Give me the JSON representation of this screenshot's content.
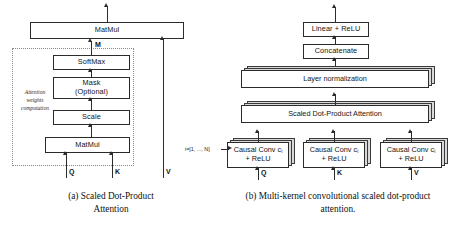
{
  "figure": {
    "panels": [
      {
        "id": "a",
        "caption_label": "(a)",
        "caption": "(a) Scaled Dot-Product\nAttention",
        "caption_line1": "(a) Scaled Dot-Product",
        "caption_line2": "Attention",
        "group_label_line1": "Attention",
        "group_label_line2": "weights",
        "group_label_line3": "computation",
        "nodes": [
          {
            "id": "matmul_top",
            "label": "MatMul"
          },
          {
            "id": "softmax",
            "label": "SoftMax"
          },
          {
            "id": "mask_l1",
            "label": "Mask"
          },
          {
            "id": "mask_l2",
            "label": "(Optional)"
          },
          {
            "id": "scale",
            "label": "Scale"
          },
          {
            "id": "matmul_bottom",
            "label": "MatMul"
          }
        ],
        "edge_labels": [
          {
            "id": "m",
            "label": "M"
          }
        ],
        "inputs": [
          {
            "id": "q",
            "label": "Q"
          },
          {
            "id": "k",
            "label": "K"
          },
          {
            "id": "v",
            "label": "V"
          }
        ]
      },
      {
        "id": "b",
        "caption_label": "(b)",
        "caption_line1": "(b) Multi-kernel convolutional scaled dot-product",
        "caption_line2": "attention.",
        "nodes": [
          {
            "id": "linear_relu",
            "label": "Linear + ReLU"
          },
          {
            "id": "concatenate",
            "label": "Concatenate"
          },
          {
            "id": "layer_norm",
            "label": "Layer normalization"
          },
          {
            "id": "sdpa",
            "label": "Scaled Dot-Product Attention"
          },
          {
            "id": "conv_q_l1",
            "label": "Causal Conv c",
            "label_sub": "i",
            "label_l2": "+ ReLU"
          },
          {
            "id": "conv_k_l1",
            "label": "Causal Conv c",
            "label_sub": "i",
            "label_l2": "+ ReLU"
          },
          {
            "id": "conv_v_l1",
            "label": "Causal Conv c",
            "label_sub": "i",
            "label_l2": "+ ReLU"
          }
        ],
        "annotations": [
          {
            "id": "index_range",
            "label": "i=[1, ..., N]"
          }
        ],
        "inputs": [
          {
            "id": "q",
            "label": "Q"
          },
          {
            "id": "k",
            "label": "K"
          },
          {
            "id": "v",
            "label": "V"
          }
        ]
      }
    ],
    "colors": {
      "stroke": "#2b2b2b",
      "stack_fill": "#d9d9d9",
      "box_fill": "#ffffff",
      "dotted": "#8a8a8a",
      "background": "#ffffff"
    }
  }
}
